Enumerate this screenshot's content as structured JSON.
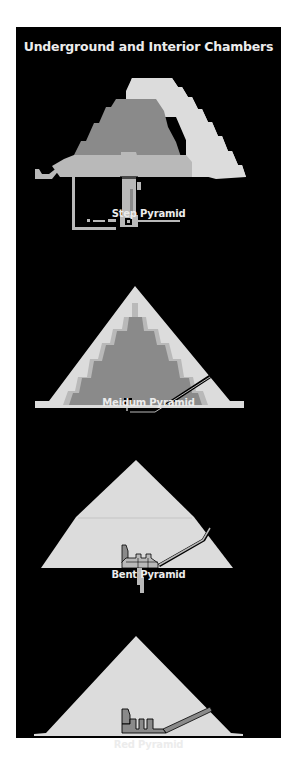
{
  "title": "Underground and Interior Chambers",
  "colors": {
    "background": "#000000",
    "light": "#dcdcdc",
    "medium": "#b9b9b9",
    "dark": "#8a8a8a",
    "text": "#ececec"
  },
  "figures": [
    {
      "id": "step",
      "label": "Step Pyramid"
    },
    {
      "id": "meidum",
      "label": "Meidum Pyramid"
    },
    {
      "id": "bent",
      "label": "Bent Pyramid"
    },
    {
      "id": "red",
      "label": "Red Pyramid"
    }
  ]
}
